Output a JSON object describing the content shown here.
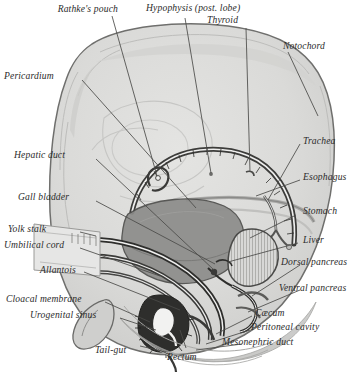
{
  "figure": {
    "type": "anatomical-illustration",
    "palette": {
      "paper": "#ffffff",
      "body_fill": "#dcdcdb",
      "body_outline": "#6f6f6d",
      "inner_shade": "#c9c9c7",
      "gut_dark": "#3a3a38",
      "liver_fill": "#8f8f8d",
      "leader_line": "#4a4a48",
      "label_text": "#2b2b2b"
    }
  },
  "labels": {
    "rathkes_pouch": "Rathke's pouch",
    "hypophysis": "Hypophysis (post. lobe)",
    "thyroid": "Thyroid",
    "notochord": "Notochord",
    "pericardium": "Pericardium",
    "trachea": "Trachea",
    "hepatic_duct": "Hepatic duct",
    "esophagus": "Esophagus",
    "gall_bladder": "Gall bladder",
    "stomach": "Stomach",
    "yolk_stalk": "Yolk stalk",
    "liver": "Liver",
    "umbilical_cord": "Umbilical cord",
    "dorsal_pancreas": "Dorsal pancreas",
    "allantois": "Allantois",
    "ventral_pancreas": "Ventral pancreas",
    "cloacal_membrane": "Cloacal membrane",
    "caecum": "Cæcum",
    "urogenital_sinus": "Urogenital sinus",
    "peritoneal_cavity": "Peritoneal cavity",
    "tail_gut": "Tail-gut",
    "rectum": "Rectum",
    "mesonephric_duct": "Mesonephric duct"
  }
}
